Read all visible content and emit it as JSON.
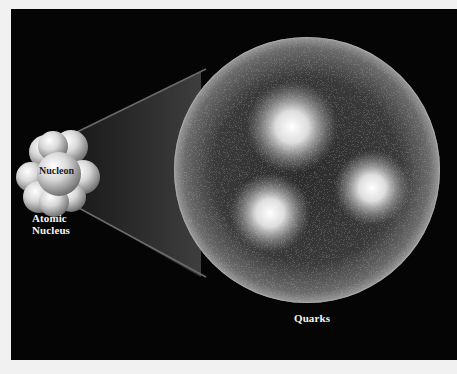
{
  "figure": {
    "background_color": "#050505",
    "page_color": "#f1f1f1"
  },
  "labels": {
    "nucleon": "Nucleon",
    "atomic_line1": "Atomic",
    "atomic_line2": "Nucleus",
    "quarks": "Quarks"
  },
  "nucleus": {
    "center": [
      52,
      160
    ],
    "nucleon_count_visible": 9
  },
  "nucleon_sphere": {
    "center": [
      296,
      161
    ],
    "radius": 133
  },
  "quarks": [
    {
      "x": 281,
      "y": 118
    },
    {
      "x": 361,
      "y": 179
    },
    {
      "x": 259,
      "y": 204
    }
  ]
}
